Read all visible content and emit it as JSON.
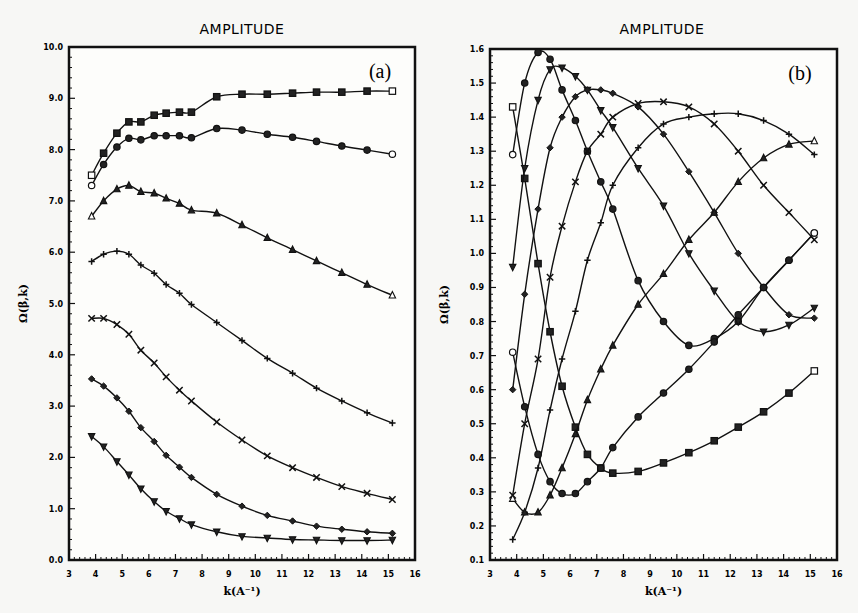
{
  "chart_data": [
    {
      "type": "line",
      "panel": "a",
      "title": "AMPLITUDE",
      "panel_label": "(a)",
      "xlabel": "k(A⁻¹)",
      "ylabel": "Ω(β,k)",
      "xlim": [
        3,
        16
      ],
      "ylim": [
        0.0,
        10.0
      ],
      "xticks": [
        "3",
        "4",
        "5",
        "6",
        "7",
        "8",
        "9",
        "10",
        "11",
        "12",
        "13",
        "14",
        "15",
        "16"
      ],
      "yticks": [
        "0.0",
        "1.0",
        "2.0",
        "3.0",
        "4.0",
        "5.0",
        "6.0",
        "7.0",
        "8.0",
        "9.0",
        "10.0"
      ],
      "grid": false,
      "x": [
        3.85,
        4.3,
        4.8,
        5.25,
        5.7,
        6.2,
        6.65,
        7.15,
        7.6,
        8.55,
        9.5,
        10.45,
        11.4,
        12.3,
        13.25,
        14.2,
        15.15
      ],
      "series": [
        {
          "name": "square",
          "marker": "square",
          "values": [
            7.5,
            7.93,
            8.32,
            8.54,
            8.54,
            8.67,
            8.71,
            8.73,
            8.73,
            9.03,
            9.08,
            9.08,
            9.1,
            9.12,
            9.12,
            9.14,
            9.14
          ]
        },
        {
          "name": "circle",
          "marker": "circle",
          "values": [
            7.3,
            7.71,
            8.05,
            8.22,
            8.19,
            8.27,
            8.27,
            8.27,
            8.23,
            8.41,
            8.38,
            8.3,
            8.24,
            8.16,
            8.07,
            7.99,
            7.91
          ]
        },
        {
          "name": "triangle",
          "marker": "triangle",
          "values": [
            6.7,
            7.0,
            7.23,
            7.3,
            7.18,
            7.15,
            7.05,
            6.95,
            6.82,
            6.76,
            6.53,
            6.28,
            6.05,
            5.83,
            5.6,
            5.37,
            5.16
          ]
        },
        {
          "name": "plus",
          "marker": "plus",
          "values": [
            5.82,
            5.96,
            6.02,
            5.96,
            5.75,
            5.59,
            5.37,
            5.2,
            4.98,
            4.63,
            4.28,
            3.93,
            3.64,
            3.35,
            3.1,
            2.87,
            2.67
          ]
        },
        {
          "name": "x",
          "marker": "x",
          "values": [
            4.71,
            4.71,
            4.59,
            4.4,
            4.09,
            3.84,
            3.57,
            3.31,
            3.1,
            2.69,
            2.34,
            2.03,
            1.8,
            1.61,
            1.43,
            1.3,
            1.18
          ]
        },
        {
          "name": "diamond",
          "marker": "diamond",
          "values": [
            3.53,
            3.39,
            3.16,
            2.9,
            2.58,
            2.31,
            2.04,
            1.81,
            1.61,
            1.28,
            1.05,
            0.87,
            0.76,
            0.66,
            0.6,
            0.55,
            0.52
          ]
        },
        {
          "name": "triangle-down",
          "marker": "triangle-down",
          "values": [
            2.41,
            2.21,
            1.92,
            1.66,
            1.39,
            1.14,
            0.95,
            0.81,
            0.69,
            0.55,
            0.46,
            0.43,
            0.4,
            0.39,
            0.38,
            0.38,
            0.39
          ]
        }
      ]
    },
    {
      "type": "line",
      "panel": "b",
      "title": "AMPLITUDE",
      "panel_label": "(b)",
      "xlabel": "k(A⁻¹)",
      "ylabel": "Ω(β,k)",
      "xlim": [
        3,
        16
      ],
      "ylim": [
        0.1,
        1.6
      ],
      "xticks": [
        "3",
        "4",
        "5",
        "6",
        "7",
        "8",
        "9",
        "10",
        "11",
        "12",
        "13",
        "14",
        "15",
        "16"
      ],
      "yticks": [
        "0.1",
        "0.2",
        "0.3",
        "0.4",
        "0.5",
        "0.6",
        "0.7",
        "0.8",
        "0.9",
        "1.0",
        "1.1",
        "1.2",
        "1.3",
        "1.4",
        "1.5",
        "1.6"
      ],
      "grid": false,
      "x": [
        3.85,
        4.3,
        4.8,
        5.25,
        5.7,
        6.2,
        6.65,
        7.15,
        7.6,
        8.55,
        9.5,
        10.45,
        11.4,
        12.3,
        13.25,
        14.2,
        15.15
      ],
      "series": [
        {
          "name": "square",
          "marker": "square",
          "values": [
            1.43,
            1.22,
            0.97,
            0.77,
            0.61,
            0.49,
            0.41,
            0.37,
            0.355,
            0.36,
            0.385,
            0.415,
            0.45,
            0.49,
            0.535,
            0.59,
            0.655
          ]
        },
        {
          "name": "circle",
          "marker": "circle",
          "values": [
            1.29,
            1.5,
            1.59,
            1.57,
            1.48,
            1.39,
            1.3,
            1.21,
            1.13,
            0.92,
            0.8,
            0.73,
            0.75,
            0.8,
            0.9,
            0.98,
            1.06
          ]
        },
        {
          "name": "triangle-down",
          "marker": "triangle-down",
          "values": [
            0.96,
            1.25,
            1.45,
            1.54,
            1.545,
            1.52,
            1.48,
            1.42,
            1.37,
            1.25,
            1.14,
            1.0,
            0.89,
            0.8,
            0.77,
            0.79,
            0.84
          ]
        },
        {
          "name": "diamond",
          "marker": "diamond",
          "values": [
            0.6,
            0.88,
            1.13,
            1.31,
            1.4,
            1.46,
            1.48,
            1.48,
            1.47,
            1.43,
            1.35,
            1.24,
            1.12,
            1.0,
            0.9,
            0.82,
            0.81
          ]
        },
        {
          "name": "x",
          "marker": "x",
          "values": [
            0.29,
            0.5,
            0.69,
            0.93,
            1.08,
            1.21,
            1.3,
            1.35,
            1.4,
            1.44,
            1.445,
            1.43,
            1.38,
            1.3,
            1.2,
            1.12,
            1.04
          ]
        },
        {
          "name": "plus",
          "marker": "plus",
          "values": [
            0.16,
            0.24,
            0.37,
            0.54,
            0.69,
            0.83,
            0.98,
            1.09,
            1.2,
            1.31,
            1.38,
            1.4,
            1.41,
            1.41,
            1.39,
            1.35,
            1.29
          ]
        },
        {
          "name": "triangle",
          "marker": "triangle",
          "values": [
            0.28,
            0.24,
            0.24,
            0.29,
            0.37,
            0.47,
            0.57,
            0.66,
            0.73,
            0.85,
            0.94,
            1.04,
            1.12,
            1.21,
            1.28,
            1.32,
            1.33
          ]
        },
        {
          "name": "hexagon",
          "marker": "circle",
          "values": [
            0.71,
            0.55,
            0.41,
            0.33,
            0.295,
            0.295,
            0.33,
            0.37,
            0.43,
            0.52,
            0.59,
            0.66,
            0.74,
            0.82,
            0.9,
            0.98,
            1.06
          ]
        }
      ]
    }
  ],
  "layout": {
    "panels": [
      {
        "plot_left": 69,
        "plot_right": 415,
        "plot_top": 47,
        "plot_bottom": 560,
        "title_x": 242,
        "title_y": 34,
        "letter_x": 380,
        "letter_y": 78
      },
      {
        "plot_left": 490,
        "plot_right": 837,
        "plot_top": 49,
        "plot_bottom": 560,
        "title_x": 662,
        "title_y": 34,
        "letter_x": 800,
        "letter_y": 80
      }
    ]
  }
}
